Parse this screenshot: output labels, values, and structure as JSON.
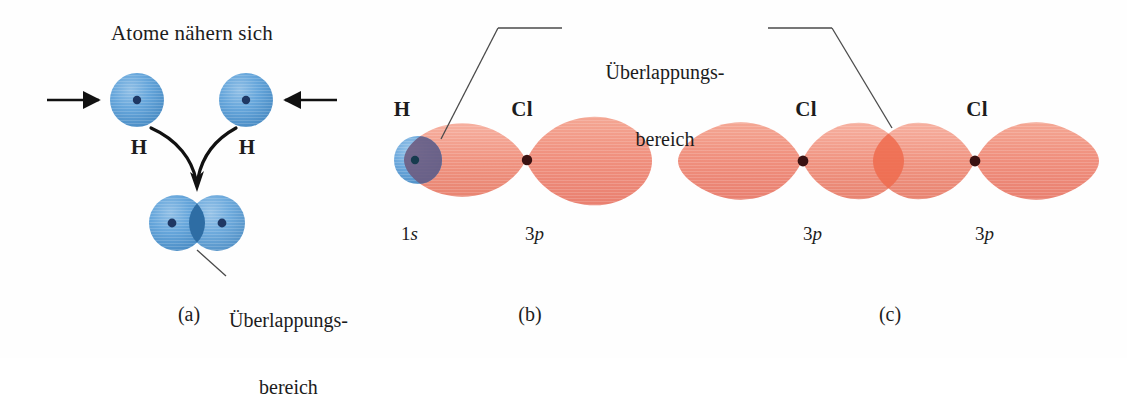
{
  "figure": {
    "title_a": "Atome nähern sich",
    "overlap_label_line1": "Überlappungs-",
    "overlap_label_line2": "bereich",
    "panels": [
      {
        "key": "a",
        "caption": "(a)"
      },
      {
        "key": "b",
        "caption": "(b)"
      },
      {
        "key": "c",
        "caption": "(c)"
      }
    ],
    "panel_a": {
      "heading": "Atome nähern sich",
      "atom_left_label": "H",
      "atom_right_label": "H",
      "overlap_label_line1": "Überlappungs-",
      "overlap_label_line2": "bereich",
      "caption": "(a)",
      "sphere_color": "#5B9BD5",
      "nucleus_color": "#1F3864",
      "arrow_color": "#111111"
    },
    "panel_b": {
      "atom_left_label": "H",
      "atom_right_label": "Cl",
      "orbital_left_label": "1s",
      "orbital_left_n": "1",
      "orbital_left_type": "s",
      "orbital_right_label": "3p",
      "orbital_right_n": "3",
      "orbital_right_type": "p",
      "caption": "(b)",
      "s_orbital_color": "#6AA4DB",
      "p_orbital_color": "#F0907E",
      "overlap_color": "#6C5A7E",
      "nucleus_color": "#3A1212"
    },
    "panel_c": {
      "atom_left_label": "Cl",
      "atom_right_label": "Cl",
      "orbital_left_label": "3p",
      "orbital_left_n": "3",
      "orbital_left_type": "p",
      "orbital_right_label": "3p",
      "orbital_right_n": "3",
      "orbital_right_type": "p",
      "caption": "(c)",
      "p_orbital_color": "#F0907E",
      "overlap_color": "#EE6B4E",
      "nucleus_color": "#3A1212"
    },
    "colors": {
      "background": "#FEFEFE",
      "leader_line": "#4A4A4A",
      "text": "#1C1C1C",
      "blue_sphere": "#5B9BD5",
      "blue_sphere_dark": "#2F6FA8",
      "blue_overlap": "#2E6DA4",
      "red_lobe": "#F0907E",
      "red_overlap": "#EE6B4E"
    }
  }
}
